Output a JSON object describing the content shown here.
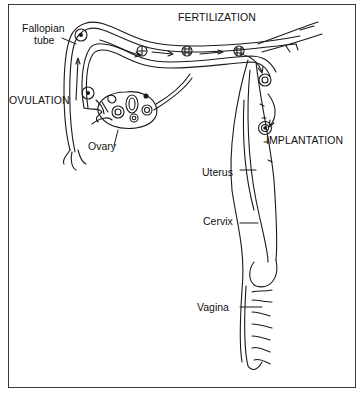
{
  "diagram": {
    "stages": {
      "fertilization": "FERTILIZATION",
      "ovulation": "OVULATION",
      "implantation": "IMPLANTATION"
    },
    "parts": {
      "fallopian_tube_line1": "Fallopian",
      "fallopian_tube_line2": "tube",
      "ovary": "Ovary",
      "uterus": "Uterus",
      "cervix": "Cervix",
      "vagina": "Vagina"
    },
    "colors": {
      "line": "#1a1a1a",
      "background": "#ffffff",
      "frame": "#3a3a3a"
    }
  }
}
